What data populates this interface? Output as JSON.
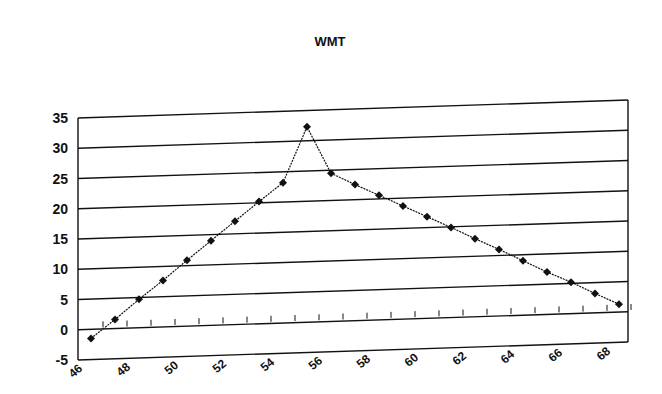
{
  "chart_data": {
    "type": "line",
    "title": "WMT",
    "xlabel": "",
    "ylabel": "",
    "x": [
      46,
      47,
      48,
      49,
      50,
      51,
      52,
      53,
      54,
      55,
      56,
      57,
      58,
      59,
      60,
      61,
      62,
      63,
      64,
      65,
      66,
      67,
      68
    ],
    "series": [
      {
        "name": "WMT",
        "values": [
          -1.5,
          1.5,
          4.7,
          7.7,
          10.9,
          14.0,
          17.1,
          20.2,
          23.2,
          32.3,
          24.5,
          22.5,
          20.6,
          18.7,
          16.8,
          14.9,
          12.9,
          11.0,
          9.0,
          7.0,
          5.2,
          3.2,
          1.3
        ],
        "marker": "diamond",
        "color": "#111111"
      }
    ],
    "xticks": [
      "46",
      "48",
      "50",
      "52",
      "54",
      "56",
      "58",
      "60",
      "62",
      "64",
      "66",
      "68"
    ],
    "yticks": [
      "-5",
      "0",
      "5",
      "10",
      "15",
      "20",
      "25",
      "30",
      "35"
    ],
    "ylim": [
      -5,
      35
    ],
    "xlim": [
      46,
      68
    ],
    "grid": true,
    "legend": "none",
    "style": "3d-perspective"
  }
}
